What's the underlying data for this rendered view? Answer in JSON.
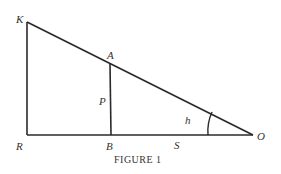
{
  "diagram": {
    "caption": "FIGURE 1",
    "points": {
      "K": {
        "label": "K",
        "x": 27,
        "y": 22
      },
      "A": {
        "label": "A",
        "x": 110,
        "y": 64
      },
      "R": {
        "label": "R",
        "x": 27,
        "y": 135
      },
      "B": {
        "label": "B",
        "x": 111,
        "y": 135
      },
      "O": {
        "label": "O",
        "x": 253,
        "y": 135
      }
    },
    "segment_labels": {
      "P": "P",
      "S": "S",
      "h": "h"
    },
    "colors": {
      "line": "#2a2a2a",
      "text": "#333333",
      "background": "#ffffff"
    }
  }
}
